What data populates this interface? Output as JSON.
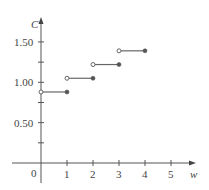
{
  "chart_data": {
    "type": "line",
    "subtype": "step",
    "title": "",
    "xlabel": "w",
    "ylabel": "C",
    "xlim": [
      0,
      5.5
    ],
    "ylim": [
      0,
      1.65
    ],
    "x_ticks": [
      1,
      2,
      3,
      4,
      5
    ],
    "x_tick_labels": [
      "1",
      "2",
      "3",
      "4",
      "5"
    ],
    "y_ticks": [
      0.25,
      0.5,
      0.75,
      1.0,
      1.25,
      1.5
    ],
    "y_tick_labels": [
      "",
      "0.50",
      "",
      "1.00",
      "",
      "1.50"
    ],
    "origin_label": "0",
    "grid": false,
    "legend": null,
    "segments": [
      {
        "x_start": 0,
        "x_end": 1,
        "y": 0.88,
        "start": "open",
        "end": "closed"
      },
      {
        "x_start": 1,
        "x_end": 2,
        "y": 1.05,
        "start": "open",
        "end": "closed"
      },
      {
        "x_start": 2,
        "x_end": 3,
        "y": 1.22,
        "start": "open",
        "end": "closed"
      },
      {
        "x_start": 3,
        "x_end": 4,
        "y": 1.39,
        "start": "open",
        "end": "closed"
      }
    ],
    "x": [
      0,
      1,
      2,
      3
    ],
    "values": [
      0.88,
      1.05,
      1.22,
      1.39
    ]
  },
  "colors": {
    "axis": "#555555",
    "segment": "#666666",
    "point_fill": "#555555"
  }
}
